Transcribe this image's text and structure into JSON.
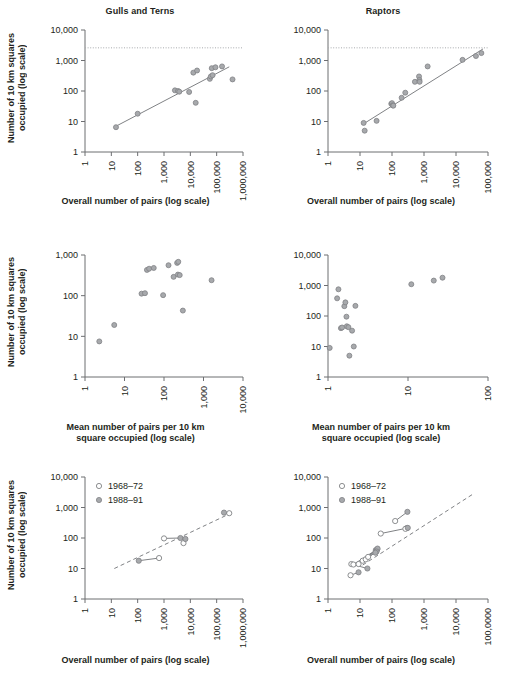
{
  "figure": {
    "axis_labels": {
      "y_occupied": "Number of 10 km squares\noccupied (log scale)",
      "x_overall": "Overall number of pairs (log scale)",
      "x_mean": "Mean number of pairs per 10 km\nsquare occupied (log scale)"
    },
    "legend": {
      "early_label": "1968–72",
      "late_label": "1988–91"
    },
    "colors": {
      "marker_fill": "#a7a9ac",
      "marker_stroke": "#808285",
      "axis": "#6d6e71",
      "text": "#231f20"
    }
  },
  "chart_data": [
    {
      "id": "gulls-terns-overall",
      "type": "scatter",
      "title": "Gulls and Terns",
      "xlabel": "Overall number of pairs (log scale)",
      "ylabel": "Number of 10 km squares occupied (log scale)",
      "xlim": [
        1,
        1000000
      ],
      "ylim": [
        1,
        10000
      ],
      "xscale": "log",
      "yscale": "log",
      "xticks": [
        "1",
        "10",
        "100",
        "1,000",
        "10,000",
        "100,000",
        "1,000,000"
      ],
      "yticks": [
        "1",
        "10",
        "100",
        "1,000",
        "10,000"
      ],
      "grid": false,
      "reference_line": {
        "type": "horizontal-dotted",
        "y": 2600,
        "label": ""
      },
      "trend_line": {
        "type": "solid",
        "x": [
          15,
          300000
        ],
        "y": [
          7,
          620
        ]
      },
      "points": [
        {
          "x": 15,
          "y": 6.5
        },
        {
          "x": 100,
          "y": 18
        },
        {
          "x": 2600,
          "y": 105
        },
        {
          "x": 3400,
          "y": 100
        },
        {
          "x": 3800,
          "y": 95
        },
        {
          "x": 9000,
          "y": 93
        },
        {
          "x": 13000,
          "y": 400
        },
        {
          "x": 18000,
          "y": 470
        },
        {
          "x": 16000,
          "y": 41
        },
        {
          "x": 55000,
          "y": 250
        },
        {
          "x": 60000,
          "y": 300
        },
        {
          "x": 70000,
          "y": 330
        },
        {
          "x": 65000,
          "y": 560
        },
        {
          "x": 90000,
          "y": 600
        },
        {
          "x": 160000,
          "y": 640
        },
        {
          "x": 400000,
          "y": 240
        }
      ]
    },
    {
      "id": "raptors-overall",
      "type": "scatter",
      "title": "Raptors",
      "xlabel": "Overall number of pairs (log scale)",
      "ylabel": "Number of 10 km squares occupied (log scale)",
      "xlim": [
        1,
        100000
      ],
      "ylim": [
        1,
        10000
      ],
      "xscale": "log",
      "yscale": "log",
      "xticks": [
        "1",
        "10",
        "100",
        "1,000",
        "10,000",
        "100,000"
      ],
      "yticks": [
        "1",
        "10",
        "100",
        "1,000",
        "10,000"
      ],
      "grid": false,
      "reference_line": {
        "type": "horizontal-dotted",
        "y": 2600,
        "label": ""
      },
      "trend_line": {
        "type": "solid",
        "x": [
          12,
          70000
        ],
        "y": [
          8,
          2400
        ]
      },
      "points": [
        {
          "x": 13,
          "y": 9
        },
        {
          "x": 14,
          "y": 5
        },
        {
          "x": 33,
          "y": 10.5
        },
        {
          "x": 95,
          "y": 38
        },
        {
          "x": 100,
          "y": 40
        },
        {
          "x": 105,
          "y": 34
        },
        {
          "x": 110,
          "y": 33
        },
        {
          "x": 200,
          "y": 60
        },
        {
          "x": 260,
          "y": 88
        },
        {
          "x": 520,
          "y": 200
        },
        {
          "x": 700,
          "y": 300
        },
        {
          "x": 720,
          "y": 230
        },
        {
          "x": 730,
          "y": 200
        },
        {
          "x": 1300,
          "y": 640
        },
        {
          "x": 16000,
          "y": 1050
        },
        {
          "x": 42000,
          "y": 1400
        },
        {
          "x": 62000,
          "y": 1750
        }
      ]
    },
    {
      "id": "gulls-terns-mean",
      "type": "scatter",
      "title": "",
      "xlabel": "Mean number of pairs per 10 km square occupied (log scale)",
      "ylabel": "Number of 10 km squares occupied (log scale)",
      "xlim": [
        1,
        10000
      ],
      "ylim": [
        1,
        1000
      ],
      "xscale": "log",
      "yscale": "log",
      "xticks": [
        "1",
        "10",
        "100",
        "1,000",
        "10,000"
      ],
      "yticks": [
        "1",
        "10",
        "100",
        "1,000"
      ],
      "grid": false,
      "points": [
        {
          "x": 2.3,
          "y": 7.5
        },
        {
          "x": 5.5,
          "y": 19
        },
        {
          "x": 27,
          "y": 112
        },
        {
          "x": 33,
          "y": 115
        },
        {
          "x": 37,
          "y": 430
        },
        {
          "x": 42,
          "y": 460
        },
        {
          "x": 55,
          "y": 480
        },
        {
          "x": 95,
          "y": 103
        },
        {
          "x": 130,
          "y": 560
        },
        {
          "x": 175,
          "y": 290
        },
        {
          "x": 215,
          "y": 640
        },
        {
          "x": 230,
          "y": 680
        },
        {
          "x": 225,
          "y": 330
        },
        {
          "x": 250,
          "y": 320
        },
        {
          "x": 300,
          "y": 43
        },
        {
          "x": 1600,
          "y": 240
        }
      ]
    },
    {
      "id": "raptors-mean",
      "type": "scatter",
      "title": "",
      "xlabel": "Mean number of pairs per 10 km square occupied (log scale)",
      "ylabel": "Number of 10 km squares occupied (log scale)",
      "xlim": [
        1,
        100
      ],
      "ylim": [
        1,
        10000
      ],
      "xscale": "log",
      "yscale": "log",
      "xticks": [
        "1",
        "10",
        "100"
      ],
      "yticks": [
        "1",
        "10",
        "100",
        "1,000",
        "10,000"
      ],
      "grid": false,
      "points": [
        {
          "x": 1.05,
          "y": 9
        },
        {
          "x": 1.35,
          "y": 750
        },
        {
          "x": 1.3,
          "y": 380
        },
        {
          "x": 1.45,
          "y": 40
        },
        {
          "x": 1.5,
          "y": 42
        },
        {
          "x": 1.6,
          "y": 210
        },
        {
          "x": 1.65,
          "y": 280
        },
        {
          "x": 1.7,
          "y": 95
        },
        {
          "x": 1.72,
          "y": 46
        },
        {
          "x": 1.8,
          "y": 43
        },
        {
          "x": 1.85,
          "y": 5
        },
        {
          "x": 2.0,
          "y": 33
        },
        {
          "x": 2.1,
          "y": 10
        },
        {
          "x": 2.2,
          "y": 215
        },
        {
          "x": 11,
          "y": 1100
        },
        {
          "x": 21,
          "y": 1450
        },
        {
          "x": 27,
          "y": 1800
        }
      ]
    },
    {
      "id": "gulls-terns-change",
      "type": "scatter",
      "title": "",
      "xlabel": "Overall number of pairs (log scale)",
      "ylabel": "Number of 10 km squares occupied (log scale)",
      "xlim": [
        1,
        1000000
      ],
      "ylim": [
        1,
        10000
      ],
      "xscale": "log",
      "yscale": "log",
      "xticks": [
        "1",
        "10",
        "100",
        "1,000",
        "10,000",
        "100,000",
        "1,000,000"
      ],
      "yticks": [
        "1",
        "10",
        "100",
        "1,000",
        "10,000"
      ],
      "grid": false,
      "legend_position": "top-left",
      "trend_line": {
        "type": "dashed",
        "x": [
          13,
          400000
        ],
        "y": [
          10,
          690
        ]
      },
      "pairs": [
        {
          "early": {
            "x": 650,
            "y": 22
          },
          "late": {
            "x": 110,
            "y": 18
          }
        },
        {
          "early": {
            "x": 1000,
            "y": 97
          },
          "late": {
            "x": 4200,
            "y": 100
          }
        },
        {
          "early": {
            "x": 5500,
            "y": 68
          },
          "late": {
            "x": 6500,
            "y": 93
          }
        },
        {
          "early": {
            "x": 300000,
            "y": 650
          },
          "late": {
            "x": 190000,
            "y": 680
          }
        }
      ]
    },
    {
      "id": "raptors-change",
      "type": "scatter",
      "title": "",
      "xlabel": "Overall number of pairs (log scale)",
      "ylabel": "Number of 10 km squares occupied (log scale)",
      "xlim": [
        1,
        1000000
      ],
      "ylim": [
        1,
        10000
      ],
      "xscale": "log",
      "yscale": "log",
      "xticks": [
        "1",
        "10",
        "100",
        "1,000",
        "10,000",
        "100,0000"
      ],
      "yticks": [
        "1",
        "10",
        "100",
        "1,000",
        "10,000"
      ],
      "grid": false,
      "legend_position": "top-left",
      "trend_line": {
        "type": "dashed",
        "x": [
          20,
          300000
        ],
        "y": [
          13,
          2900
        ]
      },
      "pairs": [
        {
          "early": {
            "x": 7,
            "y": 6
          },
          "late": {
            "x": 14,
            "y": 7.5
          }
        },
        {
          "early": {
            "x": 7.5,
            "y": 14
          },
          "late": {
            "x": 30,
            "y": 10
          }
        },
        {
          "early": {
            "x": 9,
            "y": 13.5
          },
          "late": {
            "x": 62,
            "y": 40
          }
        },
        {
          "early": {
            "x": 14,
            "y": 14
          },
          "late": {
            "x": 70,
            "y": 42
          }
        },
        {
          "early": {
            "x": 20,
            "y": 18
          },
          "late": {
            "x": 72,
            "y": 45
          }
        },
        {
          "early": {
            "x": 26,
            "y": 20
          },
          "late": {
            "x": 66,
            "y": 36
          }
        },
        {
          "early": {
            "x": 32,
            "y": 24
          },
          "late": {
            "x": 60,
            "y": 33
          }
        },
        {
          "early": {
            "x": 95,
            "y": 140
          },
          "late": {
            "x": 900,
            "y": 210
          }
        },
        {
          "early": {
            "x": 330,
            "y": 360
          },
          "late": {
            "x": 950,
            "y": 720
          }
        },
        {
          "early": {
            "x": 800,
            "y": 200
          },
          "late": {
            "x": 980,
            "y": 215
          }
        }
      ]
    }
  ]
}
